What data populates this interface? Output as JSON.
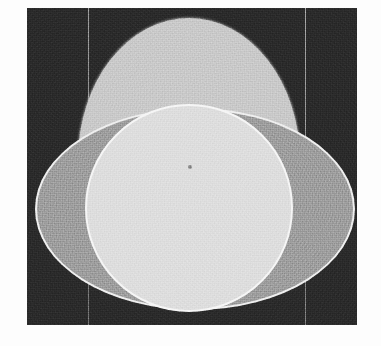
{
  "image": {
    "kind": "grayscale-geometric-scan",
    "width_px": 381,
    "height_px": 346,
    "caption": "",
    "background_color": "#2b2b2b",
    "page_color": "#fdfdfd"
  },
  "plate": {
    "left_px": 27,
    "top_px": 8,
    "width_px": 330,
    "height_px": 317
  },
  "guides": [
    {
      "name": "left-guide-line",
      "x_px": 61,
      "color": "#c8c8c8"
    },
    {
      "name": "right-guide-line",
      "x_px": 278,
      "color": "#bcbcbc"
    }
  ],
  "shapes": [
    {
      "name": "ellipse-tall",
      "orientation": "vertical",
      "center_x_px": 162,
      "center_y_px": 152,
      "semi_axis_x_px": 111,
      "semi_axis_y_px": 142,
      "fill_color": "#c9c9c9",
      "rim_color": "#e1e1e1"
    },
    {
      "name": "ellipse-wide",
      "orientation": "horizontal",
      "center_x_px": 168,
      "center_y_px": 201,
      "semi_axis_x_px": 160,
      "semi_axis_y_px": 101,
      "fill_color": "#9e9e9e",
      "rim_color": "#ededed"
    },
    {
      "name": "circle-bright",
      "orientation": "circle",
      "center_x_px": 162,
      "center_y_px": 200,
      "radius_px": 104,
      "fill_color": "#dcdcdc",
      "rim_color": "#f4f4f4"
    }
  ],
  "markers": [
    {
      "name": "center-dot",
      "x_px": 163,
      "y_px": 159,
      "diameter_px": 4,
      "color": "#8d8d8d"
    }
  ]
}
